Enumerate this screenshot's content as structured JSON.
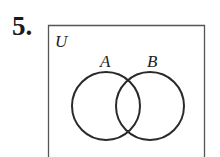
{
  "problem": {
    "number": "5."
  },
  "diagram": {
    "type": "venn",
    "universe_label": "U",
    "sets": [
      {
        "label": "A"
      },
      {
        "label": "B"
      }
    ],
    "stroke_color": "#2a2a2a",
    "shading": "none"
  }
}
